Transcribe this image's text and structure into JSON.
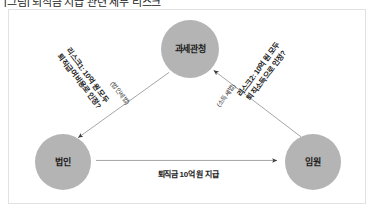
{
  "caption": {
    "text": "[그림] 퇴직금 지급 관련 세무 리스크"
  },
  "figure": {
    "background_color": "#ffffff",
    "border_color": "#e2e2e2",
    "node_color": "#b4b4b4",
    "line_color": "#9a9a9a",
    "text_color": "#1d1d1d"
  },
  "nodes": [
    {
      "id": "tax-authority",
      "label": "과세관청"
    },
    {
      "id": "corporation",
      "label": "법인"
    },
    {
      "id": "executive",
      "label": "임원"
    }
  ],
  "edges": [
    {
      "id": "risk1",
      "from": "tax-authority",
      "to": "corporation",
      "direction": "down-left",
      "label_line1": "리스크1: 10억 원 모두",
      "label_line2": "퇴직급여비용로 인정?",
      "sublabel": "(법인세법)"
    },
    {
      "id": "risk2",
      "from": "executive",
      "to": "tax-authority",
      "direction": "up-left",
      "label_line1": "리스크2: 10억 원 모두",
      "label_line2": "퇴직소득으로 인정?",
      "sublabel": "(소득세법)"
    },
    {
      "id": "payment",
      "from": "corporation",
      "to": "executive",
      "direction": "right",
      "label": "퇴직금 10억 원 지급"
    }
  ]
}
